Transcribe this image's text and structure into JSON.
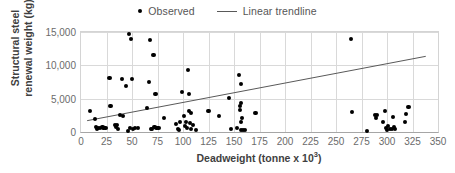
{
  "chart_data": {
    "type": "scatter",
    "title": "",
    "xlabel": "Deadweight (tonne x 10³)",
    "ylabel": "Structural steel renewal weight (kg)",
    "ylabel_line1": "Structural steel",
    "ylabel_line2": "renewal weight (kg)",
    "xlabel_base": "Deadweight (tonne x 10",
    "xlabel_exponent": "3",
    "xlabel_close": ")",
    "xlim": [
      0,
      350
    ],
    "ylim": [
      0,
      15000
    ],
    "xticks": [
      0,
      25,
      50,
      75,
      100,
      125,
      150,
      175,
      200,
      225,
      250,
      275,
      300,
      325,
      350
    ],
    "xtick_labels": [
      "0",
      "25",
      "50",
      "75",
      "100",
      "125",
      "150",
      "175",
      "200",
      "225",
      "250",
      "275",
      "300",
      "325",
      "350"
    ],
    "yticks": [
      0,
      5000,
      10000,
      15000
    ],
    "ytick_labels": [
      "0",
      "5,000",
      "10,000",
      "15,000"
    ],
    "grid": true,
    "legend_position": "top-center",
    "series": [
      {
        "name": "Observed",
        "type": "scatter",
        "marker": "circle",
        "color": "#000000",
        "points": [
          [
            9,
            3200
          ],
          [
            14,
            2000
          ],
          [
            15,
            700
          ],
          [
            16,
            400
          ],
          [
            17,
            550
          ],
          [
            19,
            620
          ],
          [
            21,
            700
          ],
          [
            22,
            600
          ],
          [
            24,
            650
          ],
          [
            28,
            8150
          ],
          [
            29,
            3850
          ],
          [
            33,
            1000
          ],
          [
            34,
            700
          ],
          [
            35,
            1050
          ],
          [
            36,
            400
          ],
          [
            38,
            2550
          ],
          [
            40,
            8000
          ],
          [
            41,
            2350
          ],
          [
            44,
            6900
          ],
          [
            46,
            100
          ],
          [
            47,
            14750
          ],
          [
            48,
            550
          ],
          [
            49,
            14000
          ],
          [
            50,
            7950
          ],
          [
            51,
            500
          ],
          [
            53,
            600
          ],
          [
            56,
            600
          ],
          [
            65,
            3600
          ],
          [
            67,
            7500
          ],
          [
            68,
            13850
          ],
          [
            69,
            500
          ],
          [
            70,
            450
          ],
          [
            71,
            11550
          ],
          [
            72,
            700
          ],
          [
            73,
            5700
          ],
          [
            74,
            600
          ],
          [
            76,
            550
          ],
          [
            81,
            2050
          ],
          [
            93,
            1150
          ],
          [
            95,
            500
          ],
          [
            96,
            300
          ],
          [
            97,
            1450
          ],
          [
            99,
            6050
          ],
          [
            101,
            2450
          ],
          [
            102,
            900
          ],
          [
            103,
            1500
          ],
          [
            104,
            650
          ],
          [
            105,
            9300
          ],
          [
            106,
            3150
          ],
          [
            106,
            5750
          ],
          [
            107,
            1300
          ],
          [
            108,
            2900
          ],
          [
            108,
            500
          ],
          [
            110,
            1100
          ],
          [
            113,
            350
          ],
          [
            125,
            3150
          ],
          [
            135,
            2400
          ],
          [
            145,
            5100
          ],
          [
            147,
            400
          ],
          [
            153,
            600
          ],
          [
            155,
            8550
          ],
          [
            156,
            3900
          ],
          [
            156,
            3350
          ],
          [
            157,
            7200
          ],
          [
            157,
            4300
          ],
          [
            157,
            1500
          ],
          [
            157,
            250
          ],
          [
            158,
            2100
          ],
          [
            159,
            350
          ],
          [
            161,
            300
          ],
          [
            171,
            2900
          ],
          [
            265,
            13950
          ],
          [
            266,
            2950
          ],
          [
            280,
            100
          ],
          [
            288,
            2500
          ],
          [
            289,
            2150
          ],
          [
            290,
            2600
          ],
          [
            296,
            1500
          ],
          [
            298,
            3150
          ],
          [
            299,
            600
          ],
          [
            300,
            300
          ],
          [
            301,
            900
          ],
          [
            303,
            400
          ],
          [
            305,
            500
          ],
          [
            306,
            2300
          ],
          [
            307,
            700
          ],
          [
            308,
            450
          ],
          [
            318,
            1450
          ],
          [
            319,
            2750
          ],
          [
            321,
            3750
          ]
        ]
      },
      {
        "name": "Linear trendline",
        "type": "line",
        "color": "#595959",
        "x_start": 6,
        "y_start": 1700,
        "x_end": 338,
        "y_end": 11350
      }
    ]
  },
  "legend": {
    "items": [
      {
        "label": "Observed",
        "marker": "dot"
      },
      {
        "label": "Linear trendline",
        "marker": "line"
      }
    ]
  }
}
